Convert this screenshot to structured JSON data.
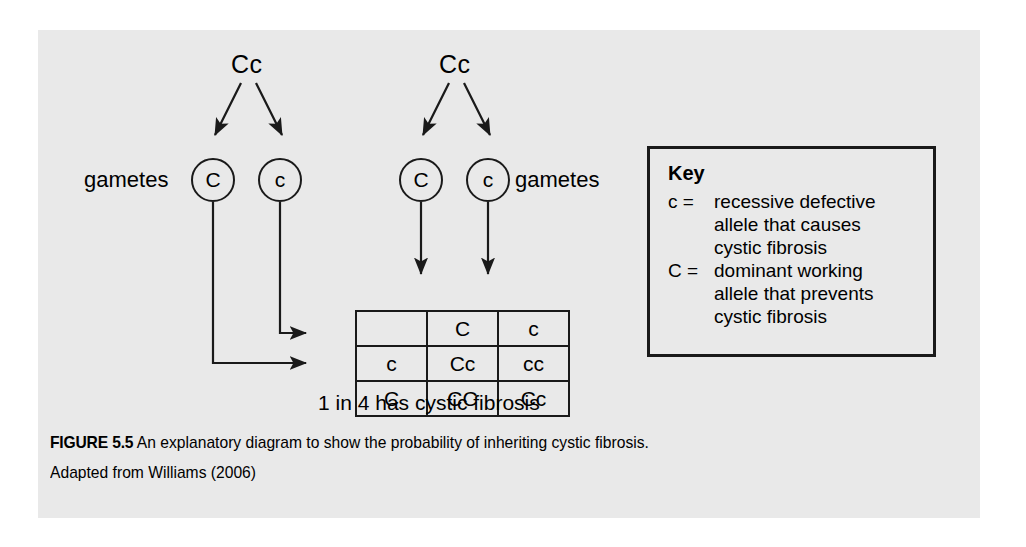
{
  "figure": {
    "panel_background": "#e9e9e9",
    "ink_color": "#1a1a1a"
  },
  "parents": [
    {
      "id": "parent-left",
      "genotype": "Cc"
    },
    {
      "id": "parent-right",
      "genotype": "Cc"
    }
  ],
  "gametes": {
    "left_label": "gametes",
    "right_label": "gametes",
    "left": [
      {
        "allele": "C"
      },
      {
        "allele": "c"
      }
    ],
    "right": [
      {
        "allele": "C"
      },
      {
        "allele": "c"
      }
    ]
  },
  "punnett": {
    "corner": "",
    "column_headers": [
      "C",
      "c"
    ],
    "row_headers": [
      "c",
      "C"
    ],
    "cells": [
      [
        "Cc",
        "cc"
      ],
      [
        "CC",
        "Cc"
      ]
    ]
  },
  "result_text": "1 in 4 has cystic fibrosis",
  "key": {
    "title": "Key",
    "entries": [
      {
        "symbol": "c =",
        "lines": [
          "recessive defective",
          "allele that causes",
          "cystic fibrosis"
        ]
      },
      {
        "symbol": "C =",
        "lines": [
          "dominant working",
          "allele that prevents",
          "cystic fibrosis"
        ]
      }
    ]
  },
  "caption": {
    "figure_label": "FIGURE 5.5",
    "title": "An explanatory diagram to show the probability of inheriting cystic fibrosis.",
    "source": "Adapted from Williams (2006)"
  }
}
